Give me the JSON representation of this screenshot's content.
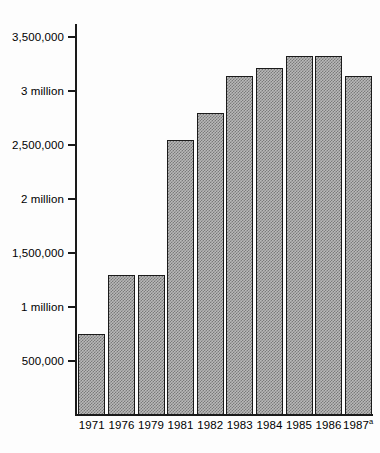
{
  "chart_data": {
    "type": "bar",
    "title": "",
    "subtitle": "",
    "xlabel": "",
    "ylabel": "",
    "categories": [
      "1971",
      "1976",
      "1979",
      "1981",
      "1982",
      "1983",
      "1984",
      "1985",
      "1986",
      "1987"
    ],
    "category_labels": [
      {
        "text": "1971",
        "superscript": ""
      },
      {
        "text": "1976",
        "superscript": ""
      },
      {
        "text": "1979",
        "superscript": ""
      },
      {
        "text": "1981",
        "superscript": ""
      },
      {
        "text": "1982",
        "superscript": ""
      },
      {
        "text": "1983",
        "superscript": ""
      },
      {
        "text": "1984",
        "superscript": ""
      },
      {
        "text": "1985",
        "superscript": ""
      },
      {
        "text": "1986",
        "superscript": ""
      },
      {
        "text": "1987",
        "superscript": "a"
      }
    ],
    "values": [
      750000,
      1300000,
      1300000,
      2550000,
      2800000,
      3140000,
      3215000,
      3320000,
      3320000,
      3140000
    ],
    "ylim": [
      0,
      3620000
    ],
    "ytick_values": [
      500000,
      1000000,
      1500000,
      2000000,
      2500000,
      3000000,
      3500000
    ],
    "ytick_labels": [
      "500,000",
      "1 million",
      "1,500,000",
      "2 million",
      "2,500,000",
      "3 million",
      "3,500,000"
    ],
    "grid": false,
    "legend": null,
    "bar_fill": "#b9b9b9",
    "bar_edge": "#1b1b1b",
    "axis_color": "#1a1a1a",
    "background": "#fdfdfd",
    "annotations": []
  }
}
